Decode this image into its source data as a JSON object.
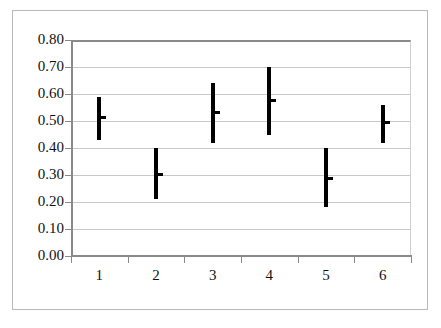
{
  "chart_data": {
    "type": "bar",
    "subtype": "range-with-mean-marker",
    "title": "",
    "subtitle": "",
    "xlabel": "",
    "ylabel": "",
    "categories": [
      "1",
      "2",
      "3",
      "4",
      "5",
      "6"
    ],
    "ylim": [
      0.0,
      0.8
    ],
    "ytick_step": 0.1,
    "ytick_labels": [
      "0.80",
      "0.70",
      "0.60",
      "0.50",
      "0.40",
      "0.30",
      "0.20",
      "0.10",
      "0.00"
    ],
    "ytick_values": [
      0.8,
      0.7,
      0.6,
      0.5,
      0.4,
      0.3,
      0.2,
      0.1,
      0.0
    ],
    "grid": true,
    "grid_axis": "y",
    "legend": false,
    "legend_position": "none",
    "series": [
      {
        "name": "range",
        "low": [
          0.43,
          0.21,
          0.42,
          0.45,
          0.18,
          0.42
        ],
        "high": [
          0.59,
          0.4,
          0.64,
          0.7,
          0.4,
          0.56
        ]
      },
      {
        "name": "mean",
        "values": [
          0.515,
          0.305,
          0.535,
          0.578,
          0.29,
          0.498
        ]
      }
    ],
    "points": [
      {
        "category": "1",
        "low": 0.43,
        "high": 0.59,
        "mean": 0.515
      },
      {
        "category": "2",
        "low": 0.21,
        "high": 0.4,
        "mean": 0.305
      },
      {
        "category": "3",
        "low": 0.42,
        "high": 0.64,
        "mean": 0.535
      },
      {
        "category": "4",
        "low": 0.45,
        "high": 0.7,
        "mean": 0.578
      },
      {
        "category": "5",
        "low": 0.18,
        "high": 0.4,
        "mean": 0.29
      },
      {
        "category": "6",
        "low": 0.42,
        "high": 0.56,
        "mean": 0.498
      }
    ],
    "colors": {
      "marker": "#000000",
      "gridline": "#c8c8c8",
      "axis": "#8a8a8a",
      "frame": "#b9b9b9",
      "background": "#ffffff",
      "text": "#111111"
    }
  }
}
